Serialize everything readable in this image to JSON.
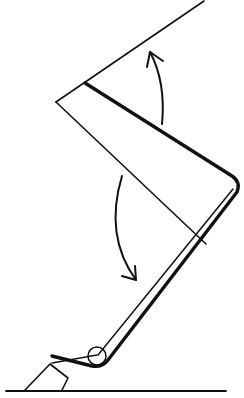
{
  "diagram": {
    "type": "mechanical-line-drawing",
    "colors": {
      "stroke": "#111111",
      "background": "#ffffff"
    },
    "elements": [
      {
        "id": "upper-panel",
        "label": ""
      },
      {
        "id": "lower-panel",
        "label": ""
      },
      {
        "id": "hinge-pivot",
        "label": ""
      },
      {
        "id": "base-support",
        "label": ""
      },
      {
        "id": "ground-line",
        "label": ""
      },
      {
        "id": "arrow-up",
        "direction": "counter-clockwise opening"
      },
      {
        "id": "arrow-down",
        "direction": "clockwise closing"
      }
    ]
  }
}
